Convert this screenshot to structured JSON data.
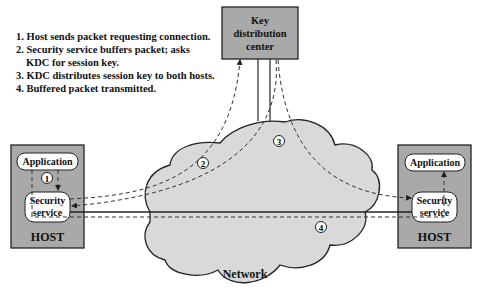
{
  "steps": [
    {
      "number": "1.",
      "text": "Host sends packet requesting connection."
    },
    {
      "number": "2.",
      "text": "Security service buffers packet; asks",
      "continuation": "KDC for session key."
    },
    {
      "number": "3.",
      "text": "KDC distributes session key to both hosts."
    },
    {
      "number": "4.",
      "text": "Buffered packet transmitted."
    }
  ],
  "kdc": {
    "line1": "Key",
    "line2": "distribution",
    "line3": "center"
  },
  "left_host": {
    "label": "HOST",
    "application": "Application",
    "security_line1": "Security",
    "security_line2": "service"
  },
  "right_host": {
    "label": "HOST",
    "application": "Application",
    "security_line1": "Security",
    "security_line2": "service"
  },
  "network": {
    "label": "Network"
  },
  "markers": {
    "m1": "1",
    "m2": "2",
    "m3": "3",
    "m4": "4"
  },
  "colors": {
    "box_fill": "#a9a9a9",
    "cloud_fill": "#d9d9d9",
    "stroke": "#222222",
    "pill_fill": "#ffffff"
  }
}
